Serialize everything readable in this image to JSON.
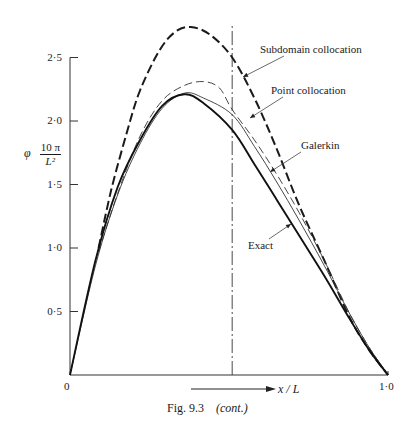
{
  "figure": {
    "caption_main": "Fig. 9.3",
    "caption_note": "(cont.)"
  },
  "chart_data": {
    "type": "line",
    "title": "",
    "xlabel": "x / L",
    "ylabel_symbol": "φ",
    "ylabel_factor_num": "10 π",
    "ylabel_factor_den": "L²",
    "xlim": [
      0,
      1.0
    ],
    "ylim": [
      0,
      2.5
    ],
    "x_ticks": [
      {
        "value": 0,
        "label": "0"
      },
      {
        "value": 1.0,
        "label": "1·0"
      }
    ],
    "y_ticks": [
      {
        "value": 0.5,
        "label": "0·5"
      },
      {
        "value": 1.0,
        "label": "1·0"
      },
      {
        "value": 1.5,
        "label": "1·5"
      },
      {
        "value": 2.0,
        "label": "2·0"
      },
      {
        "value": 2.5,
        "label": "2·5"
      }
    ],
    "grid": false,
    "legend": "inline labels with leader arrows",
    "reference_line": {
      "x": 0.51,
      "style": "dash-dot vertical"
    },
    "series": [
      {
        "name": "Subdomain collocation",
        "style": "thick dashed",
        "x": [
          0.09,
          0.13,
          0.18,
          0.22,
          0.28,
          0.33,
          0.38,
          0.44,
          0.51,
          0.58,
          0.65,
          0.72,
          0.8,
          0.88,
          0.94,
          1.0
        ],
        "y": [
          1.0,
          1.46,
          1.92,
          2.24,
          2.55,
          2.7,
          2.74,
          2.68,
          2.5,
          2.18,
          1.78,
          1.34,
          0.9,
          0.45,
          0.2,
          0.0
        ]
      },
      {
        "name": "Point collocation",
        "style": "thin dashed",
        "x": [
          0.09,
          0.15,
          0.22,
          0.29,
          0.36,
          0.42,
          0.47,
          0.51,
          0.58,
          0.65,
          0.72,
          0.8,
          0.88,
          0.94,
          1.0
        ],
        "y": [
          0.97,
          1.43,
          1.88,
          2.16,
          2.28,
          2.31,
          2.26,
          2.09,
          1.85,
          1.58,
          1.28,
          0.9,
          0.48,
          0.22,
          0.0
        ]
      },
      {
        "name": "Galerkin",
        "style": "thin solid",
        "x": [
          0.0,
          0.08,
          0.15,
          0.22,
          0.29,
          0.36,
          0.42,
          0.51,
          0.58,
          0.65,
          0.72,
          0.8,
          0.88,
          0.94,
          1.0
        ],
        "y": [
          0.0,
          0.86,
          1.42,
          1.82,
          2.1,
          2.22,
          2.18,
          2.05,
          1.8,
          1.52,
          1.22,
          0.86,
          0.48,
          0.22,
          0.0
        ]
      },
      {
        "name": "Exact",
        "style": "thick solid",
        "x": [
          0.0,
          0.08,
          0.15,
          0.22,
          0.29,
          0.36,
          0.42,
          0.51,
          0.58,
          0.65,
          0.72,
          0.8,
          0.88,
          0.94,
          1.0
        ],
        "y": [
          0.0,
          0.9,
          1.48,
          1.85,
          2.12,
          2.21,
          2.14,
          1.93,
          1.66,
          1.38,
          1.1,
          0.78,
          0.44,
          0.2,
          0.0
        ]
      }
    ],
    "annotations": [
      {
        "text": "Subdomain collocation",
        "points_to": "Subdomain collocation"
      },
      {
        "text": "Point collocation",
        "points_to": "Point collocation"
      },
      {
        "text": "Galerkin",
        "points_to": "Galerkin"
      },
      {
        "text": "Exact",
        "points_to": "Exact"
      }
    ]
  }
}
